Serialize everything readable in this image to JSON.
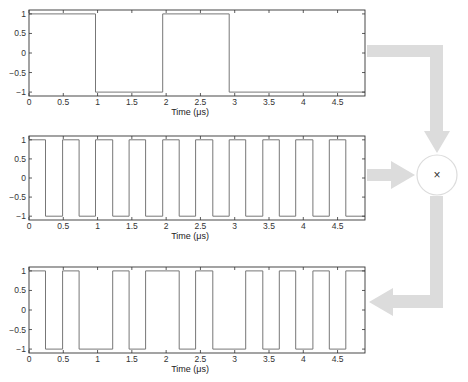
{
  "diagram": {
    "title": "",
    "mixer": {
      "symbol": "×",
      "center": [
        437,
        175
      ],
      "radius": 20
    },
    "colors": {
      "signal": "#777777",
      "axes": "#333333",
      "arrow": "#dcdcdc"
    }
  },
  "chart_data": [
    {
      "type": "line",
      "name": "data-signal",
      "title": "",
      "xlabel": "Time (μs)",
      "ylabel": "",
      "xlim": [
        0,
        4.9
      ],
      "ylim": [
        -1.1,
        1.1
      ],
      "xticks": [
        0,
        0.5,
        1,
        1.5,
        2,
        2.5,
        3,
        3.5,
        4,
        4.5
      ],
      "xtick_labels": [
        "0",
        "0.5",
        "1",
        "1.5",
        "2",
        "2.5",
        "3",
        "3.5",
        "4",
        "4.5"
      ],
      "yticks": [
        1,
        0.5,
        0,
        -0.5,
        -1
      ],
      "ytick_labels": [
        "1",
        "0.5",
        "0",
        "−0.5",
        "−1"
      ],
      "grid": false,
      "step_edges": [
        0,
        0.97,
        1.95,
        2.92,
        4.9
      ],
      "step_levels": [
        1,
        -1,
        1,
        -1
      ]
    },
    {
      "type": "line",
      "name": "carrier-signal",
      "title": "",
      "xlabel": "Time (μs)",
      "ylabel": "",
      "xlim": [
        0,
        4.9
      ],
      "ylim": [
        -1.1,
        1.1
      ],
      "xticks": [
        0,
        0.5,
        1,
        1.5,
        2,
        2.5,
        3,
        3.5,
        4,
        4.5
      ],
      "xtick_labels": [
        "0",
        "0.5",
        "1",
        "1.5",
        "2",
        "2.5",
        "3",
        "3.5",
        "4",
        "4.5"
      ],
      "yticks": [
        1,
        0.5,
        0,
        -0.5,
        -1
      ],
      "ytick_labels": [
        "1",
        "0.5",
        "0",
        "−0.5",
        "−1"
      ],
      "grid": false,
      "step_edges": [
        0,
        0.24,
        0.49,
        0.73,
        0.97,
        1.22,
        1.46,
        1.7,
        1.95,
        2.19,
        2.43,
        2.68,
        2.92,
        3.16,
        3.41,
        3.65,
        3.89,
        4.14,
        4.38,
        4.62,
        4.9
      ],
      "step_levels": [
        1,
        -1,
        1,
        -1,
        1,
        -1,
        1,
        -1,
        1,
        -1,
        1,
        -1,
        1,
        -1,
        1,
        -1,
        1,
        -1,
        1,
        -1
      ]
    },
    {
      "type": "line",
      "name": "product-signal",
      "title": "",
      "xlabel": "Time (μs)",
      "ylabel": "",
      "xlim": [
        0,
        4.9
      ],
      "ylim": [
        -1.1,
        1.1
      ],
      "xticks": [
        0,
        0.5,
        1,
        1.5,
        2,
        2.5,
        3,
        3.5,
        4,
        4.5
      ],
      "xtick_labels": [
        "0",
        "0.5",
        "1",
        "1.5",
        "2",
        "2.5",
        "3",
        "3.5",
        "4",
        "4.5"
      ],
      "yticks": [
        1,
        0.5,
        0,
        -0.5,
        -1
      ],
      "ytick_labels": [
        "1",
        "0.5",
        "0",
        "−0.5",
        "−1"
      ],
      "grid": false,
      "step_edges": [
        0,
        0.24,
        0.49,
        0.73,
        1.22,
        1.46,
        1.7,
        2.19,
        2.43,
        2.68,
        3.16,
        3.41,
        3.65,
        3.89,
        4.14,
        4.38,
        4.62,
        4.9
      ],
      "step_levels": [
        1,
        -1,
        1,
        -1,
        1,
        -1,
        1,
        -1,
        1,
        -1,
        1,
        -1,
        1,
        -1,
        1,
        -1,
        1
      ]
    }
  ],
  "layout": {
    "plots": [
      {
        "left": 29,
        "right": 365,
        "top": 10,
        "bottom": 96
      },
      {
        "left": 29,
        "right": 365,
        "top": 136,
        "bottom": 220
      },
      {
        "left": 29,
        "right": 365,
        "top": 267,
        "bottom": 353
      }
    ]
  }
}
